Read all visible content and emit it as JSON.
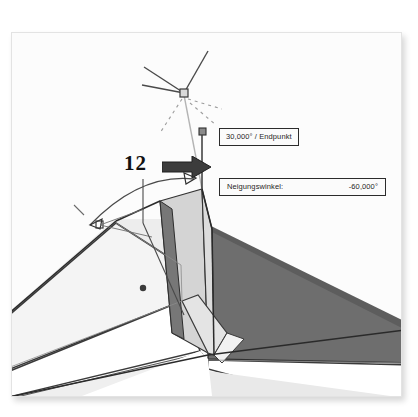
{
  "image": {
    "title": "CAD Dachkante Neigungswinkel",
    "background_color": "#ffffff",
    "frame_color": "#fdfdfd"
  },
  "annotation": {
    "step_number": "12",
    "arrow_icon": "block-arrow-right-icon",
    "arrow_color": "#3c3c3c"
  },
  "tooltips": {
    "endpoint": {
      "text": "30,000° / Endpunkt"
    },
    "angle": {
      "label": "Neigungswinkel:",
      "value": "-60,000°"
    }
  },
  "markers": {
    "snap_point": "snap-square-marker",
    "endpoint_marker": "endpoint-square-marker",
    "rotation_arc": "rotation-arc-double-arrow",
    "tracking_lines": "dashed-tracking-lines"
  },
  "colors": {
    "face_dark": "#6e6e6e",
    "face_mid": "#c9c9c9",
    "face_light": "#ededed",
    "face_white": "#fdfdfd",
    "outline": "#2a2a2a",
    "helper_line": "#9a9a9a",
    "text": "#262626"
  }
}
